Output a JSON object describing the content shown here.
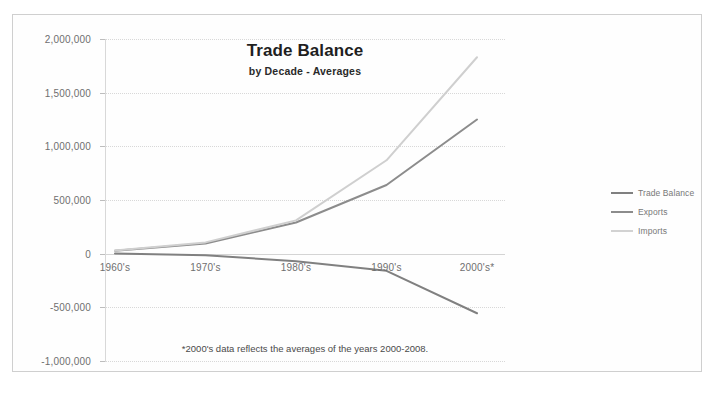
{
  "chart_data": {
    "type": "line",
    "title": "Trade Balance",
    "subtitle": "by Decade - Averages",
    "footnote": "*2000's data reflects the averages of the years 2000-2008.",
    "xlabel": "",
    "ylabel": "",
    "categories": [
      "1960's",
      "1970's",
      "1980's",
      "1990's",
      "2000's*"
    ],
    "ylim": [
      -1000000,
      2000000
    ],
    "ytick_labels": [
      "2,000,000",
      "1,500,000",
      "1,000,000",
      "500,000",
      "0",
      "-500,000",
      "-1,000,000"
    ],
    "ytick_values": [
      2000000,
      1500000,
      1000000,
      500000,
      0,
      -500000,
      -1000000
    ],
    "grid": true,
    "legend_position": "right",
    "series": [
      {
        "name": "Trade Balance",
        "color": "#808080",
        "values": [
          2000,
          -15000,
          -70000,
          -160000,
          -555000
        ]
      },
      {
        "name": "Exports",
        "color": "#8c8c8c",
        "values": [
          28000,
          95000,
          290000,
          640000,
          1250000
        ]
      },
      {
        "name": "Imports",
        "color": "#cfcfcf",
        "values": [
          30000,
          105000,
          310000,
          870000,
          1830000
        ]
      }
    ]
  },
  "legend": {
    "items": [
      {
        "label": "Trade Balance",
        "color": "#808080"
      },
      {
        "label": "Exports",
        "color": "#8c8c8c"
      },
      {
        "label": "Imports",
        "color": "#d2d2d2"
      }
    ]
  }
}
